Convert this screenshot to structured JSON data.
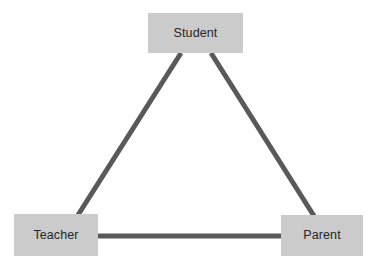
{
  "diagram": {
    "background_color": "#ffffff",
    "node_fill_color": "#cbcbcb",
    "node_text_color": "#262626",
    "connector_color": "#595959",
    "connector_width": 5,
    "nodes": [
      {
        "id": "student",
        "label": "Student",
        "x": 148,
        "y": 13,
        "width": 95,
        "height": 40
      },
      {
        "id": "teacher",
        "label": "Teacher",
        "x": 14,
        "y": 214,
        "width": 84,
        "height": 42
      },
      {
        "id": "parent",
        "label": "Parent",
        "x": 281,
        "y": 215,
        "width": 82,
        "height": 41
      }
    ],
    "edges": [
      {
        "id": "student-teacher",
        "from": "student",
        "to": "teacher",
        "x1": 181,
        "y1": 53,
        "x2": 78,
        "y2": 215
      },
      {
        "id": "student-parent",
        "from": "student",
        "to": "parent",
        "x1": 211,
        "y1": 53,
        "x2": 314,
        "y2": 216
      },
      {
        "id": "teacher-parent",
        "from": "teacher",
        "to": "parent",
        "x1": 97,
        "y1": 236,
        "x2": 282,
        "y2": 236
      }
    ]
  }
}
